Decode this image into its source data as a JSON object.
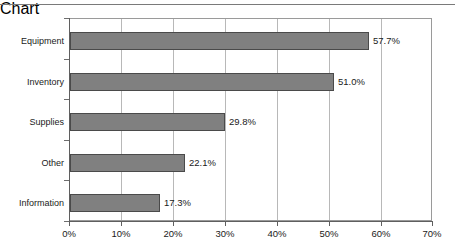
{
  "chart_data": {
    "type": "bar",
    "orientation": "horizontal",
    "title": "",
    "xlabel": "",
    "ylabel": "",
    "categories": [
      "Equipment",
      "Inventory",
      "Supplies",
      "Other",
      "Information"
    ],
    "values": [
      57.7,
      51.0,
      29.8,
      22.1,
      17.3
    ],
    "data_labels": [
      "57.7%",
      "51.0%",
      "29.8%",
      "22.1%",
      "17.3%"
    ],
    "xlim": [
      0,
      70
    ],
    "xticks": [
      0,
      10,
      20,
      30,
      40,
      50,
      60,
      70
    ],
    "xtick_labels": [
      "0%",
      "10%",
      "20%",
      "30%",
      "40%",
      "50%",
      "60%",
      "70%"
    ],
    "grid": "vertical",
    "legend": "none",
    "bar_color": "#808080",
    "bar_edge_color": "#4a4a4a",
    "grid_color": "#b8b8b8",
    "axis_color": "#5f5f5f",
    "background": "#ffffff"
  }
}
